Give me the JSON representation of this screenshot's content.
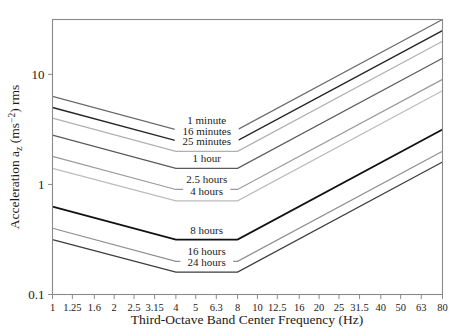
{
  "chart_data": {
    "type": "line",
    "title": "",
    "xlabel": "Third-Octave Band Center Frequency (Hz)",
    "ylabel": "Acceleration a₂ (ms⁻²) rms",
    "ylabel_parts": {
      "pre": "Acceleration a",
      "sub": "z",
      "post": " (ms",
      "sup": "−2",
      "tail": ") rms"
    },
    "xscale": "log",
    "yscale": "log",
    "xlim": [
      1,
      80
    ],
    "ylim": [
      0.1,
      31.5
    ],
    "grid": false,
    "legend": "inline-labels",
    "xticks": [
      1,
      1.25,
      1.6,
      2,
      2.5,
      3.15,
      4,
      5,
      6.3,
      8,
      10,
      12.5,
      16,
      20,
      25,
      31.5,
      40,
      50,
      63,
      80
    ],
    "xticklabels": [
      "1",
      "1.25",
      "1.6",
      "2",
      "2.5",
      "3.15",
      "4",
      "5",
      "6.3",
      "8",
      "10",
      "12.5",
      "16",
      "20",
      "25",
      "31.5",
      "40",
      "50",
      "63",
      "80"
    ],
    "yticks": [
      0.1,
      1,
      10
    ],
    "yticklabels": [
      "0.1",
      "1",
      "10"
    ],
    "series": [
      {
        "name": "1 minute",
        "label": "1 minute",
        "color": "#6a6a6a",
        "width": 1.2,
        "x": [
          1,
          4,
          8,
          80
        ],
        "y": [
          6.3,
          3.15,
          3.15,
          31.5
        ]
      },
      {
        "name": "16 minutes",
        "label": "16 minutes",
        "color": "#262626",
        "width": 1.5,
        "x": [
          1,
          4,
          8,
          80
        ],
        "y": [
          5.0,
          2.5,
          2.5,
          25.0
        ]
      },
      {
        "name": "25 minutes",
        "label": "25 minutes",
        "color": "#b0b0b0",
        "width": 1.2,
        "x": [
          1,
          4,
          8,
          80
        ],
        "y": [
          4.0,
          2.0,
          2.0,
          20.0
        ]
      },
      {
        "name": "1 hour",
        "label": "1 hour",
        "color": "#5a5a5a",
        "width": 1.2,
        "x": [
          1,
          4,
          8,
          80
        ],
        "y": [
          2.8,
          1.4,
          1.4,
          14.0
        ]
      },
      {
        "name": "2.5 hours",
        "label": "2.5 hours",
        "color": "#9a9a9a",
        "width": 1.2,
        "x": [
          1,
          4,
          8,
          80
        ],
        "y": [
          1.8,
          0.9,
          0.9,
          9.0
        ]
      },
      {
        "name": "4 hours",
        "label": "4 hours",
        "color": "#bcbcbc",
        "width": 1.2,
        "x": [
          1,
          4,
          8,
          80
        ],
        "y": [
          1.4,
          0.71,
          0.71,
          7.1
        ]
      },
      {
        "name": "8 hours",
        "label": "8 hours",
        "color": "#111111",
        "width": 1.8,
        "x": [
          1,
          4,
          8,
          80
        ],
        "y": [
          0.63,
          0.315,
          0.315,
          3.15
        ]
      },
      {
        "name": "16 hours",
        "label": "16 hours",
        "color": "#8f8f8f",
        "width": 1.2,
        "x": [
          1,
          4,
          8,
          80
        ],
        "y": [
          0.4,
          0.2,
          0.2,
          2.0
        ]
      },
      {
        "name": "24 hours",
        "label": "24 hours",
        "color": "#3d3d3d",
        "width": 1.3,
        "x": [
          1,
          4,
          8,
          80
        ],
        "y": [
          0.315,
          0.16,
          0.16,
          1.6
        ]
      }
    ]
  },
  "colors": {
    "frame": "#8a8a8a",
    "text": "#1a1a1a",
    "background": "#ffffff"
  }
}
